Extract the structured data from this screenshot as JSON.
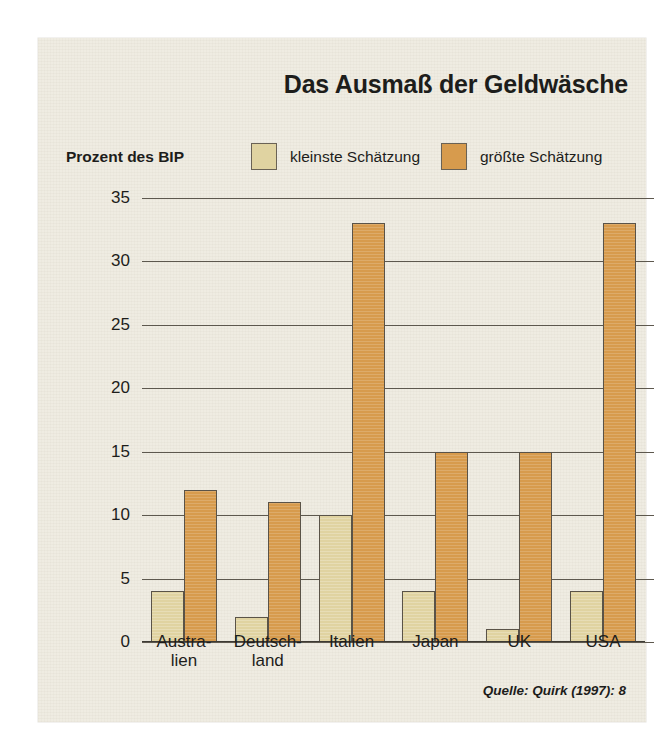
{
  "figure": {
    "title": "Das Ausmaß der Geldwäsche",
    "unit_label": "Prozent des BIP",
    "source_note": "Quelle: Quirk (1997): 8",
    "colors": {
      "min_estimate": "#e0d3a1",
      "max_estimate": "#d79b4d",
      "panel_background": "#efece2",
      "grid": "#5d584e",
      "text": "#1d1d1b"
    }
  },
  "chart_data": {
    "type": "bar",
    "title": "Das Ausmaß der Geldwäsche",
    "xlabel": "",
    "ylabel": "Prozent des BIP",
    "ylim": [
      0,
      35
    ],
    "yticks": [
      0,
      5,
      10,
      15,
      20,
      25,
      30,
      35
    ],
    "ytick_labels": [
      "0",
      "5",
      "10",
      "15",
      "20",
      "25",
      "30",
      "35"
    ],
    "grid": true,
    "legend_position": "top",
    "categories": [
      "Austra-\nlien",
      "Deutsch-\nland",
      "Italien",
      "Japan",
      "UK",
      "USA"
    ],
    "category_lines": [
      [
        "Austra-",
        "lien"
      ],
      [
        "Deutsch-",
        "land"
      ],
      [
        "Italien",
        ""
      ],
      [
        "Japan",
        ""
      ],
      [
        "UK",
        ""
      ],
      [
        "USA",
        ""
      ]
    ],
    "series": [
      {
        "name": "kleinste Schätzung",
        "color": "#e0d3a1",
        "values": [
          4,
          2,
          10,
          4,
          1,
          4
        ]
      },
      {
        "name": "größte Schätzung",
        "color": "#d79b4d",
        "values": [
          12,
          11,
          33,
          15,
          15,
          33
        ]
      }
    ],
    "annotations": [
      "Quelle: Quirk (1997): 8"
    ]
  }
}
